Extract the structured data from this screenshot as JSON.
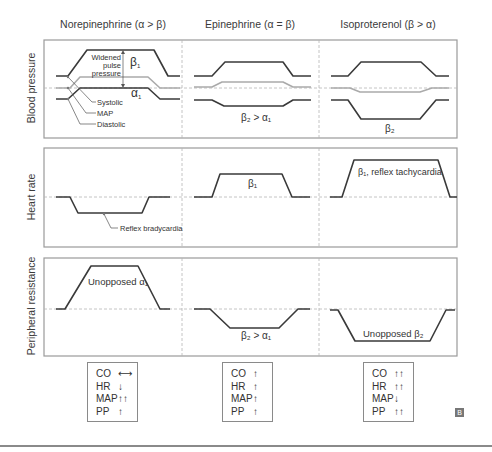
{
  "columns": [
    {
      "id": "norepinephrine",
      "title": "Norepinephrine (α > β)"
    },
    {
      "id": "epinephrine",
      "title": "Epinephrine (α = β)"
    },
    {
      "id": "isoproterenol",
      "title": "Isoproterenol (β > α)"
    }
  ],
  "rows": [
    {
      "id": "blood-pressure",
      "label": "Blood pressure"
    },
    {
      "id": "heart-rate",
      "label": "Heart rate"
    },
    {
      "id": "peripheral-resistance",
      "label": "Peripheral resistance"
    }
  ],
  "annotations": {
    "bp_norepi_beta": "β",
    "bp_norepi_beta_sub": "1",
    "bp_norepi_alpha": "α",
    "bp_norepi_alpha_sub": "1",
    "widened_pulse_pressure": [
      "Widened",
      "pulse",
      "pressure"
    ],
    "systolic": "Systolic",
    "map": "MAP",
    "diastolic": "Diastolic",
    "bp_epi": "β₂ > α₁",
    "bp_iso": "β₂",
    "hr_reflex_brady": "Reflex bradycardia",
    "hr_epi": "β₁",
    "hr_iso": "β₁, reflex tachycardia",
    "pr_norepi": "Unopposed α₁",
    "pr_epi": "β₂ > α₁",
    "pr_iso": "Unopposed β₂"
  },
  "summaries": [
    {
      "drug": "Norepinephrine",
      "items": [
        {
          "k": "CO",
          "v": "⟷"
        },
        {
          "k": "HR",
          "v": "↓"
        },
        {
          "k": "MAP",
          "v": "↑↑"
        },
        {
          "k": "PP",
          "v": "↑"
        }
      ]
    },
    {
      "drug": "Epinephrine",
      "items": [
        {
          "k": "CO",
          "v": "↑"
        },
        {
          "k": "HR",
          "v": "↑"
        },
        {
          "k": "MAP",
          "v": "↑"
        },
        {
          "k": "PP",
          "v": "↑"
        }
      ]
    },
    {
      "drug": "Isoproterenol",
      "items": [
        {
          "k": "CO",
          "v": "↑↑"
        },
        {
          "k": "HR",
          "v": "↑↑"
        },
        {
          "k": "MAP",
          "v": "↓"
        },
        {
          "k": "PP",
          "v": "↑↑"
        }
      ]
    }
  ],
  "logo": "B",
  "colors": {
    "line_dark": "#3a3a3a",
    "line_map": "#aaaaaa",
    "frame": "#9a9a9a",
    "dashed": "#b5b5b5"
  }
}
